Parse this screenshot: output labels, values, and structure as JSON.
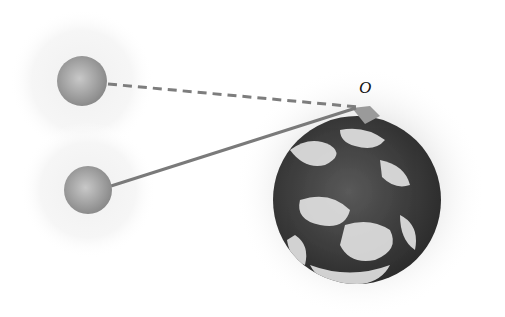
{
  "diagram": {
    "type": "physics-illustration",
    "point_label": "O",
    "objects": [
      {
        "name": "upper-sphere",
        "cx": 82,
        "cy": 81,
        "r": 25,
        "halo_r": 72
      },
      {
        "name": "lower-sphere",
        "cx": 88,
        "cy": 190,
        "r": 24,
        "halo_r": 68
      },
      {
        "name": "earth",
        "cx": 357,
        "cy": 200,
        "r": 84,
        "halo_r": 125
      }
    ],
    "lines": [
      {
        "name": "dashed-line",
        "from": [
          108,
          84
        ],
        "to": [
          358,
          107
        ],
        "style": "dashed"
      },
      {
        "name": "solid-line",
        "from": [
          111,
          186
        ],
        "to": [
          356,
          108
        ],
        "style": "solid"
      }
    ],
    "colors": {
      "sphere": "#9a9a9a",
      "line": "#7a7a7a",
      "halo": "#e6e6e6",
      "earth_ocean": "#3d3d3d",
      "earth_cloud": "#e8e8e8"
    }
  }
}
